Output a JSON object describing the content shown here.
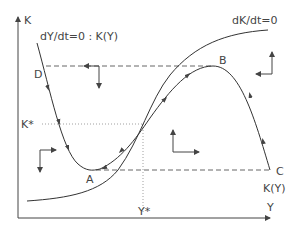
{
  "diagram": {
    "type": "phase-diagram",
    "axes": {
      "x_label": "Y",
      "y_label": "K"
    },
    "equilibrium": {
      "k_label": "K*",
      "y_label": "Y*"
    },
    "curves": {
      "dk_dt_zero": "dK/dt=0",
      "dy_dt_zero": "dY/dt=0 : K(Y)",
      "ky_label": "K(Y)"
    },
    "points": {
      "A": "A",
      "B": "B",
      "C": "C",
      "D": "D"
    },
    "colors": {
      "line": "#333333",
      "text": "#444444",
      "background": "#ffffff"
    }
  }
}
